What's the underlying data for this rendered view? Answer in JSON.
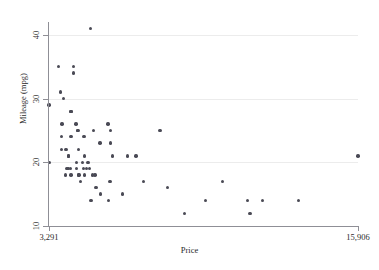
{
  "chart_data": {
    "type": "scatter",
    "title": "",
    "xlabel": "Price",
    "ylabel": "Mileage (mpg)",
    "xlim": [
      3291,
      15906
    ],
    "ylim": [
      10,
      42
    ],
    "grid": true,
    "legend": null,
    "xticks": [
      3291,
      15906
    ],
    "xticklabels": [
      "3,291",
      "15,906"
    ],
    "yticks": [
      10,
      20,
      30,
      40
    ],
    "yticklabels": [
      "10",
      "20",
      "30",
      "40"
    ],
    "marker": {
      "shape": "circle",
      "color": "#4a4a55",
      "size_px": 3.4
    },
    "axis_color": "#8f8f96",
    "gridline_color": "#ececec",
    "background_color": "#ffffff",
    "n_points": 74,
    "points": [
      {
        "x": 3291,
        "y": 29
      },
      {
        "x": 3299,
        "y": 20
      },
      {
        "x": 3667,
        "y": 35
      },
      {
        "x": 3748,
        "y": 31
      },
      {
        "x": 3798,
        "y": 24
      },
      {
        "x": 3799,
        "y": 22
      },
      {
        "x": 3829,
        "y": 26
      },
      {
        "x": 3895,
        "y": 30
      },
      {
        "x": 3955,
        "y": 18
      },
      {
        "x": 3984,
        "y": 22
      },
      {
        "x": 4010,
        "y": 19
      },
      {
        "x": 4060,
        "y": 19
      },
      {
        "x": 4082,
        "y": 21
      },
      {
        "x": 4099,
        "y": 21
      },
      {
        "x": 4172,
        "y": 19
      },
      {
        "x": 4181,
        "y": 18
      },
      {
        "x": 4187,
        "y": 28
      },
      {
        "x": 4195,
        "y": 28
      },
      {
        "x": 4187,
        "y": 24
      },
      {
        "x": 4296,
        "y": 35
      },
      {
        "x": 4295,
        "y": 34
      },
      {
        "x": 4389,
        "y": 26
      },
      {
        "x": 4424,
        "y": 19
      },
      {
        "x": 4425,
        "y": 20
      },
      {
        "x": 4453,
        "y": 25
      },
      {
        "x": 4482,
        "y": 25
      },
      {
        "x": 4499,
        "y": 18
      },
      {
        "x": 4504,
        "y": 22
      },
      {
        "x": 4516,
        "y": 18
      },
      {
        "x": 4589,
        "y": 17
      },
      {
        "x": 4647,
        "y": 20
      },
      {
        "x": 4697,
        "y": 19
      },
      {
        "x": 4723,
        "y": 24
      },
      {
        "x": 4733,
        "y": 18
      },
      {
        "x": 4749,
        "y": 21
      },
      {
        "x": 4816,
        "y": 19
      },
      {
        "x": 4890,
        "y": 20
      },
      {
        "x": 4934,
        "y": 19
      },
      {
        "x": 4995,
        "y": 41
      },
      {
        "x": 5005,
        "y": 14
      },
      {
        "x": 5079,
        "y": 18
      },
      {
        "x": 5104,
        "y": 25
      },
      {
        "x": 5172,
        "y": 18
      },
      {
        "x": 5189,
        "y": 16
      },
      {
        "x": 5222,
        "y": 16
      },
      {
        "x": 5379,
        "y": 23
      },
      {
        "x": 5397,
        "y": 15
      },
      {
        "x": 5705,
        "y": 26
      },
      {
        "x": 5719,
        "y": 14
      },
      {
        "x": 5788,
        "y": 17
      },
      {
        "x": 5798,
        "y": 23
      },
      {
        "x": 5799,
        "y": 25
      },
      {
        "x": 5886,
        "y": 21
      },
      {
        "x": 6303,
        "y": 15
      },
      {
        "x": 6486,
        "y": 21
      },
      {
        "x": 6850,
        "y": 21
      },
      {
        "x": 7140,
        "y": 17
      },
      {
        "x": 7827,
        "y": 25
      },
      {
        "x": 8129,
        "y": 16
      },
      {
        "x": 8814,
        "y": 12
      },
      {
        "x": 9690,
        "y": 14
      },
      {
        "x": 10371,
        "y": 17
      },
      {
        "x": 11385,
        "y": 14
      },
      {
        "x": 11497,
        "y": 12
      },
      {
        "x": 11995,
        "y": 14
      },
      {
        "x": 13466,
        "y": 14
      },
      {
        "x": 15906,
        "y": 21
      }
    ]
  }
}
